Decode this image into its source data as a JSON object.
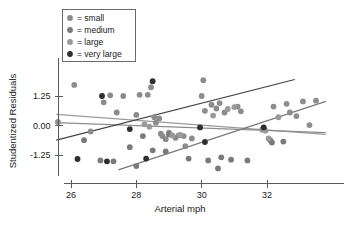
{
  "chart_data": {
    "type": "scatter",
    "title": "",
    "xlabel": "Arterial mph",
    "ylabel": "Studentized Residuals",
    "xlim": [
      25.5,
      33.8
    ],
    "ylim": [
      -2.3,
      2.3
    ],
    "xticks": [
      26,
      28,
      30,
      32
    ],
    "xticklabels": [
      "26",
      "28",
      "30",
      "32"
    ],
    "yticks": [
      1.25,
      0.0,
      -1.25
    ],
    "yticklabels": [
      "1.25",
      "0.00",
      "-1.25"
    ],
    "grid": false,
    "legend_position": "top-left",
    "legend": [
      {
        "key": "small",
        "label": "= small",
        "color": "#8c8c8c"
      },
      {
        "key": "medium",
        "label": "= medium",
        "color": "#7a7a7a"
      },
      {
        "key": "large",
        "label": "= large",
        "color": "#9a9a9a"
      },
      {
        "key": "very large",
        "label": "= very large",
        "color": "#2e2e2e"
      }
    ],
    "series": [
      {
        "name": "small",
        "color": "#8c8c8c",
        "points": [
          [
            25.6,
            0.15
          ],
          [
            26.1,
            1.72
          ],
          [
            26.6,
            -0.25
          ],
          [
            27.0,
            0.98
          ],
          [
            27.2,
            1.28
          ],
          [
            27.4,
            0.55
          ],
          [
            27.6,
            1.25
          ],
          [
            28.0,
            0.45
          ],
          [
            28.1,
            1.3
          ],
          [
            28.35,
            1.3
          ],
          [
            28.45,
            1.62
          ],
          [
            28.55,
            0.35
          ],
          [
            28.6,
            0.12
          ],
          [
            28.7,
            0.3
          ],
          [
            28.75,
            -0.35
          ],
          [
            28.8,
            -0.45
          ],
          [
            28.9,
            -0.58
          ],
          [
            29.0,
            -0.3
          ],
          [
            29.2,
            -0.52
          ],
          [
            29.3,
            -0.42
          ],
          [
            29.45,
            -0.45
          ],
          [
            29.5,
            -0.88
          ],
          [
            29.7,
            -0.55
          ],
          [
            30.0,
            1.25
          ],
          [
            30.05,
            1.92
          ],
          [
            30.1,
            0.62
          ],
          [
            30.3,
            0.88
          ],
          [
            30.45,
            0.72
          ],
          [
            30.55,
            0.95
          ],
          [
            30.7,
            0.55
          ],
          [
            31.1,
            0.8
          ],
          [
            31.2,
            0.6
          ],
          [
            32.2,
            0.8
          ],
          [
            32.6,
            0.92
          ],
          [
            32.7,
            0.55
          ],
          [
            32.9,
            0.4
          ],
          [
            33.1,
            1.02
          ],
          [
            33.3,
            0.02
          ],
          [
            33.5,
            1.05
          ]
        ]
      },
      {
        "name": "medium",
        "color": "#7a7a7a",
        "points": [
          [
            26.4,
            -0.62
          ],
          [
            26.9,
            -1.48
          ],
          [
            27.3,
            -1.52
          ],
          [
            27.8,
            -0.92
          ],
          [
            28.0,
            -1.72
          ],
          [
            28.2,
            -0.45
          ],
          [
            28.5,
            -1.05
          ],
          [
            28.9,
            -1.1
          ],
          [
            29.0,
            -0.38
          ],
          [
            29.6,
            -1.4
          ],
          [
            30.2,
            -1.48
          ],
          [
            30.5,
            -1.82
          ],
          [
            30.6,
            -1.35
          ],
          [
            30.9,
            -1.45
          ],
          [
            31.4,
            -1.48
          ],
          [
            32.1,
            -0.62
          ],
          [
            32.15,
            -0.72
          ],
          [
            32.5,
            -0.68
          ],
          [
            31.9,
            -0.12
          ]
        ]
      },
      {
        "name": "large",
        "color": "#9a9a9a",
        "points": [
          [
            28.25,
            0.05
          ],
          [
            28.4,
            -0.05
          ],
          [
            29.1,
            -0.42
          ],
          [
            29.35,
            -0.4
          ],
          [
            30.35,
            0.42
          ],
          [
            30.8,
            0.7
          ],
          [
            31.0,
            0.78
          ],
          [
            31.85,
            -0.18
          ],
          [
            31.95,
            -0.22
          ],
          [
            32.05,
            -0.55
          ],
          [
            32.35,
            0.35
          ]
        ]
      },
      {
        "name": "very large",
        "color": "#2e2e2e",
        "points": [
          [
            26.2,
            -1.42
          ],
          [
            26.95,
            1.25
          ],
          [
            27.8,
            -0.15
          ],
          [
            28.5,
            1.88
          ],
          [
            28.3,
            -1.4
          ],
          [
            29.95,
            -0.08
          ],
          [
            30.1,
            -0.7
          ],
          [
            27.1,
            -1.52
          ],
          [
            31.9,
            -0.08
          ]
        ]
      }
    ],
    "trend_lines": [
      {
        "name": "small-trend",
        "color": "#9a9a9a",
        "x0": 25.55,
        "y0": 0.47,
        "x1": 33.8,
        "y1": -0.38
      },
      {
        "name": "medium-trend",
        "color": "#8c8c8c",
        "x0": 25.55,
        "y0": 0.12,
        "x1": 33.8,
        "y1": -0.3
      },
      {
        "name": "large-trend",
        "color": "#7a7a7a",
        "x0": 27.45,
        "y0": -1.88,
        "x1": 33.8,
        "y1": 1.02
      },
      {
        "name": "very-large-trend",
        "color": "#444444",
        "x0": 25.55,
        "y0": -0.62,
        "x1": 32.85,
        "y1": 1.95
      }
    ]
  }
}
